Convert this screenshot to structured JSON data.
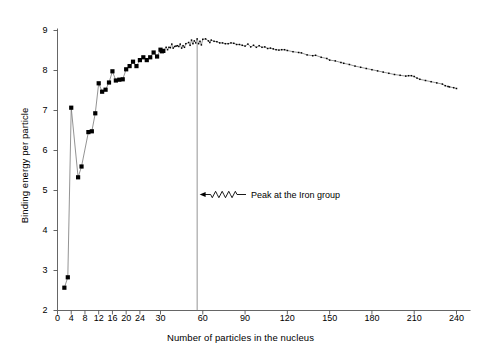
{
  "chart_data": {
    "type": "line",
    "title": "",
    "xlabel": "Number of particles in the nucleus",
    "ylabel": "Binding energy per particle",
    "xlim": [
      0,
      240
    ],
    "ylim": [
      2,
      9
    ],
    "grid": false,
    "legend": "none",
    "xticks": [
      0,
      4,
      8,
      12,
      16,
      20,
      24,
      30,
      60,
      90,
      120,
      150,
      180,
      210,
      240
    ],
    "xtick_labels": [
      "0",
      "4",
      "8",
      "12",
      "16",
      "20",
      "24",
      "30",
      "60",
      "90",
      "120",
      "150",
      "180",
      "210",
      "240"
    ],
    "yticks": [
      2,
      3,
      4,
      5,
      6,
      7,
      8,
      9
    ],
    "ytick_labels": [
      "2",
      "3",
      "4",
      "5",
      "6",
      "7",
      "8",
      "9"
    ],
    "x_scale_note": "piecewise: 0-30 expanded, 30-240 compressed",
    "annotations": [
      {
        "text": "Peak at the Iron group",
        "x": 56,
        "arrow": "wavy-left",
        "marker_line_x": 56,
        "marker_line_y_top": 2,
        "marker_line_y_bottom": 8.7
      }
    ],
    "series": [
      {
        "name": "Binding energy per nucleon",
        "marker": "filled-square-large",
        "marker_small_threshold": 32,
        "color": "#000000",
        "points": [
          {
            "x": 2,
            "y": 2.57
          },
          {
            "x": 3,
            "y": 2.83
          },
          {
            "x": 4,
            "y": 7.07
          },
          {
            "x": 6,
            "y": 5.33
          },
          {
            "x": 7,
            "y": 5.6
          },
          {
            "x": 9,
            "y": 6.46
          },
          {
            "x": 10,
            "y": 6.48
          },
          {
            "x": 11,
            "y": 6.93
          },
          {
            "x": 12,
            "y": 7.68
          },
          {
            "x": 13,
            "y": 7.47
          },
          {
            "x": 14,
            "y": 7.52
          },
          {
            "x": 15,
            "y": 7.7
          },
          {
            "x": 16,
            "y": 7.98
          },
          {
            "x": 17,
            "y": 7.75
          },
          {
            "x": 18,
            "y": 7.77
          },
          {
            "x": 19,
            "y": 7.78
          },
          {
            "x": 20,
            "y": 8.03
          },
          {
            "x": 21,
            "y": 8.11
          },
          {
            "x": 22,
            "y": 8.22
          },
          {
            "x": 23,
            "y": 8.11
          },
          {
            "x": 24,
            "y": 8.26
          },
          {
            "x": 25,
            "y": 8.33
          },
          {
            "x": 26,
            "y": 8.26
          },
          {
            "x": 27,
            "y": 8.33
          },
          {
            "x": 28,
            "y": 8.45
          },
          {
            "x": 29,
            "y": 8.35
          },
          {
            "x": 30,
            "y": 8.52
          },
          {
            "x": 31,
            "y": 8.48
          },
          {
            "x": 32,
            "y": 8.49
          },
          {
            "x": 34,
            "y": 8.58
          },
          {
            "x": 35,
            "y": 8.52
          },
          {
            "x": 36,
            "y": 8.58
          },
          {
            "x": 37,
            "y": 8.57
          },
          {
            "x": 38,
            "y": 8.66
          },
          {
            "x": 39,
            "y": 8.56
          },
          {
            "x": 40,
            "y": 8.6
          },
          {
            "x": 41,
            "y": 8.61
          },
          {
            "x": 42,
            "y": 8.62
          },
          {
            "x": 43,
            "y": 8.6
          },
          {
            "x": 44,
            "y": 8.66
          },
          {
            "x": 45,
            "y": 8.56
          },
          {
            "x": 46,
            "y": 8.62
          },
          {
            "x": 47,
            "y": 8.58
          },
          {
            "x": 48,
            "y": 8.67
          },
          {
            "x": 50,
            "y": 8.7
          },
          {
            "x": 51,
            "y": 8.63
          },
          {
            "x": 52,
            "y": 8.76
          },
          {
            "x": 53,
            "y": 8.67
          },
          {
            "x": 54,
            "y": 8.74
          },
          {
            "x": 55,
            "y": 8.69
          },
          {
            "x": 56,
            "y": 8.79
          },
          {
            "x": 57,
            "y": 8.67
          },
          {
            "x": 58,
            "y": 8.73
          },
          {
            "x": 59,
            "y": 8.64
          },
          {
            "x": 60,
            "y": 8.78
          },
          {
            "x": 62,
            "y": 8.79
          },
          {
            "x": 64,
            "y": 8.74
          },
          {
            "x": 65,
            "y": 8.7
          },
          {
            "x": 66,
            "y": 8.76
          },
          {
            "x": 68,
            "y": 8.73
          },
          {
            "x": 70,
            "y": 8.72
          },
          {
            "x": 72,
            "y": 8.69
          },
          {
            "x": 74,
            "y": 8.69
          },
          {
            "x": 76,
            "y": 8.67
          },
          {
            "x": 78,
            "y": 8.67
          },
          {
            "x": 80,
            "y": 8.69
          },
          {
            "x": 82,
            "y": 8.68
          },
          {
            "x": 84,
            "y": 8.65
          },
          {
            "x": 86,
            "y": 8.65
          },
          {
            "x": 88,
            "y": 8.63
          },
          {
            "x": 90,
            "y": 8.61
          },
          {
            "x": 92,
            "y": 8.66
          },
          {
            "x": 94,
            "y": 8.59
          },
          {
            "x": 96,
            "y": 8.63
          },
          {
            "x": 98,
            "y": 8.58
          },
          {
            "x": 100,
            "y": 8.62
          },
          {
            "x": 102,
            "y": 8.58
          },
          {
            "x": 104,
            "y": 8.59
          },
          {
            "x": 106,
            "y": 8.55
          },
          {
            "x": 108,
            "y": 8.56
          },
          {
            "x": 110,
            "y": 8.54
          },
          {
            "x": 112,
            "y": 8.52
          },
          {
            "x": 114,
            "y": 8.51
          },
          {
            "x": 116,
            "y": 8.52
          },
          {
            "x": 118,
            "y": 8.52
          },
          {
            "x": 120,
            "y": 8.5
          },
          {
            "x": 124,
            "y": 8.47
          },
          {
            "x": 128,
            "y": 8.45
          },
          {
            "x": 130,
            "y": 8.44
          },
          {
            "x": 134,
            "y": 8.39
          },
          {
            "x": 138,
            "y": 8.37
          },
          {
            "x": 140,
            "y": 8.38
          },
          {
            "x": 144,
            "y": 8.33
          },
          {
            "x": 148,
            "y": 8.3
          },
          {
            "x": 150,
            "y": 8.26
          },
          {
            "x": 154,
            "y": 8.24
          },
          {
            "x": 158,
            "y": 8.2
          },
          {
            "x": 160,
            "y": 8.18
          },
          {
            "x": 164,
            "y": 8.15
          },
          {
            "x": 168,
            "y": 8.11
          },
          {
            "x": 172,
            "y": 8.08
          },
          {
            "x": 176,
            "y": 8.05
          },
          {
            "x": 180,
            "y": 8.02
          },
          {
            "x": 184,
            "y": 7.99
          },
          {
            "x": 188,
            "y": 7.96
          },
          {
            "x": 192,
            "y": 7.93
          },
          {
            "x": 196,
            "y": 7.9
          },
          {
            "x": 200,
            "y": 7.88
          },
          {
            "x": 204,
            "y": 7.86
          },
          {
            "x": 206,
            "y": 7.87
          },
          {
            "x": 208,
            "y": 7.87
          },
          {
            "x": 210,
            "y": 7.85
          },
          {
            "x": 212,
            "y": 7.81
          },
          {
            "x": 214,
            "y": 7.78
          },
          {
            "x": 218,
            "y": 7.75
          },
          {
            "x": 222,
            "y": 7.72
          },
          {
            "x": 226,
            "y": 7.69
          },
          {
            "x": 230,
            "y": 7.66
          },
          {
            "x": 232,
            "y": 7.62
          },
          {
            "x": 234,
            "y": 7.6
          },
          {
            "x": 235,
            "y": 7.59
          },
          {
            "x": 238,
            "y": 7.57
          },
          {
            "x": 240,
            "y": 7.55
          }
        ]
      }
    ]
  },
  "style": {
    "axis_color": "#555555",
    "line_color": "#777777",
    "marker_color": "#000000",
    "background": "#ffffff",
    "annotation_color": "#000000"
  }
}
